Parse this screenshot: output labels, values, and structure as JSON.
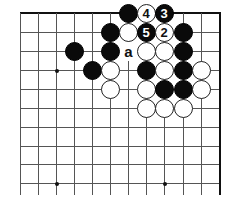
{
  "board": {
    "columns_x": [
      20,
      38,
      56,
      74,
      92,
      110,
      128,
      146,
      164,
      183,
      201,
      220
    ],
    "rows_y": [
      13,
      32,
      51,
      70,
      89,
      108,
      127,
      146,
      164,
      183
    ],
    "grid_bottom": 195,
    "grid_left": 20,
    "top_edge": true,
    "right_edge": true,
    "colors": {
      "black": "#0a0a0a",
      "white": "#ffffff",
      "line": "#555555"
    },
    "star_points": [
      {
        "col": 2,
        "row": 3
      },
      {
        "col": 2,
        "row": 9
      },
      {
        "col": 8,
        "row": 9
      }
    ],
    "stones": [
      {
        "col": 6,
        "row": 0,
        "color": "black",
        "label": ""
      },
      {
        "col": 7,
        "row": 0,
        "color": "white",
        "label": "4"
      },
      {
        "col": 8,
        "row": 0,
        "color": "black",
        "label": "3"
      },
      {
        "col": 5,
        "row": 1,
        "color": "black",
        "label": ""
      },
      {
        "col": 6,
        "row": 1,
        "color": "white",
        "label": ""
      },
      {
        "col": 7,
        "row": 1,
        "color": "black",
        "label": "5"
      },
      {
        "col": 8,
        "row": 1,
        "color": "white",
        "label": "2"
      },
      {
        "col": 9,
        "row": 1,
        "color": "black",
        "label": ""
      },
      {
        "col": 3,
        "row": 2,
        "color": "black",
        "label": ""
      },
      {
        "col": 5,
        "row": 2,
        "color": "black",
        "label": ""
      },
      {
        "col": 7,
        "row": 2,
        "color": "white",
        "label": ""
      },
      {
        "col": 8,
        "row": 2,
        "color": "white",
        "label": ""
      },
      {
        "col": 9,
        "row": 2,
        "color": "black",
        "label": ""
      },
      {
        "col": 4,
        "row": 3,
        "color": "black",
        "label": ""
      },
      {
        "col": 5,
        "row": 3,
        "color": "white",
        "label": ""
      },
      {
        "col": 7,
        "row": 3,
        "color": "black",
        "label": ""
      },
      {
        "col": 8,
        "row": 3,
        "color": "white",
        "label": ""
      },
      {
        "col": 9,
        "row": 3,
        "color": "black",
        "label": ""
      },
      {
        "col": 10,
        "row": 3,
        "color": "white",
        "label": ""
      },
      {
        "col": 5,
        "row": 4,
        "color": "white",
        "label": ""
      },
      {
        "col": 7,
        "row": 4,
        "color": "white",
        "label": ""
      },
      {
        "col": 8,
        "row": 4,
        "color": "black",
        "label": ""
      },
      {
        "col": 9,
        "row": 4,
        "color": "black",
        "label": ""
      },
      {
        "col": 10,
        "row": 4,
        "color": "white",
        "label": ""
      },
      {
        "col": 7,
        "row": 5,
        "color": "white",
        "label": ""
      },
      {
        "col": 8,
        "row": 5,
        "color": "white",
        "label": ""
      },
      {
        "col": 9,
        "row": 5,
        "color": "white",
        "label": ""
      }
    ],
    "markers": [
      {
        "col": 6,
        "row": 2,
        "text": "a"
      }
    ]
  }
}
